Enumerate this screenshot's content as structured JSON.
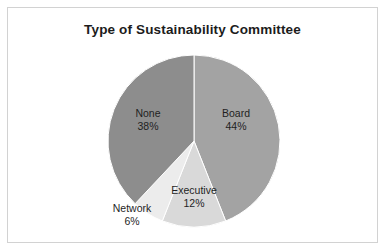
{
  "chart_data": {
    "type": "pie",
    "title": "Type of Sustainability Committee",
    "categories": [
      "Board",
      "Executive",
      "Network",
      "None"
    ],
    "values": [
      44,
      12,
      6,
      38
    ],
    "unit": "%",
    "start_angle_deg": 0,
    "direction": "clockwise",
    "legend": "none",
    "labels_position": "on-slice",
    "slices": [
      {
        "name": "Board",
        "value": 44,
        "value_label": "44%",
        "color": "#a3a3a3",
        "label_x": 228,
        "label_y": 111
      },
      {
        "name": "Executive",
        "value": 12,
        "value_label": "12%",
        "color": "#d9d9d9",
        "label_x": 186,
        "label_y": 188
      },
      {
        "name": "Network",
        "value": 6,
        "value_label": "6%",
        "color": "#ececec",
        "label_x": 124,
        "label_y": 206
      },
      {
        "name": "None",
        "value": 38,
        "value_label": "38%",
        "color": "#8d8d8d",
        "label_x": 140,
        "label_y": 111
      }
    ],
    "geometry": {
      "cx": 186,
      "cy": 133,
      "r": 86
    }
  },
  "frame": {
    "border_color": "#d2d2d2",
    "background": "#ffffff"
  }
}
